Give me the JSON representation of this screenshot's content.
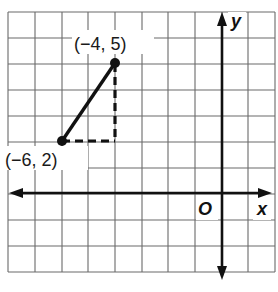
{
  "diagram": {
    "type": "coordinate-plane",
    "grid": {
      "x_min": -8,
      "x_max": 2,
      "y_min": -3,
      "y_max": 7,
      "step": 1
    },
    "axes": {
      "x_label": "x",
      "y_label": "y",
      "origin_label": "O"
    },
    "points": [
      {
        "name": "A",
        "x": -4,
        "y": 5,
        "label": "(−4, 5)"
      },
      {
        "name": "B",
        "x": -6,
        "y": 2,
        "label": "(−6, 2)"
      }
    ],
    "segments": [
      {
        "from": "B",
        "to": "A",
        "style": "solid"
      },
      {
        "from": "B",
        "to": "(-4, 2)",
        "style": "dashed"
      },
      {
        "from": "(-4, 2)",
        "to": "A",
        "style": "dashed"
      }
    ],
    "colors": {
      "grid": "#555555",
      "axes": "#111111",
      "segment": "#111111",
      "background": "#ffffff"
    }
  }
}
